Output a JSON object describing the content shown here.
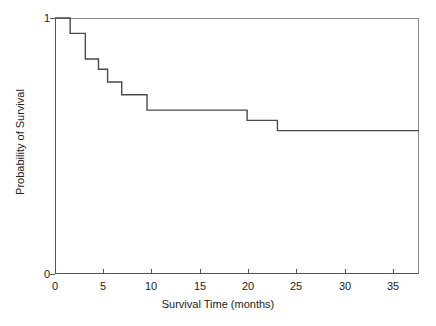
{
  "chart_data": {
    "type": "line",
    "title": "",
    "subtitle": "",
    "xlabel": "Survival Time (months)",
    "ylabel": "Probability of Survival",
    "xlim": [
      0,
      36
    ],
    "ylim": [
      0,
      1
    ],
    "xticks": [
      0,
      5,
      10,
      15,
      20,
      25,
      30,
      35
    ],
    "xtick_labels": [
      "0",
      "5",
      "10",
      "15",
      "20",
      "25",
      "30",
      "35"
    ],
    "yticks": [
      0,
      1
    ],
    "ytick_labels": [
      "0",
      "1"
    ],
    "grid": false,
    "legend": null,
    "annotations": [],
    "series": [
      {
        "name": "Kaplan-Meier survival estimate",
        "style": "step-post",
        "color": "#4a4a4a",
        "x": [
          0,
          1.5,
          1.5,
          3.0,
          3.0,
          4.3,
          4.3,
          5.2,
          5.2,
          6.6,
          6.6,
          9.1,
          9.1,
          19.0,
          19.0,
          22.0,
          22.0,
          36.0
        ],
        "y": [
          1.0,
          1.0,
          0.94,
          0.94,
          0.84,
          0.84,
          0.8,
          0.8,
          0.75,
          0.75,
          0.7,
          0.7,
          0.64,
          0.64,
          0.6,
          0.6,
          0.56,
          0.56
        ],
        "steps": [
          {
            "time": 0.0,
            "survival": 1.0
          },
          {
            "time": 1.5,
            "survival": 0.94
          },
          {
            "time": 3.0,
            "survival": 0.84
          },
          {
            "time": 4.3,
            "survival": 0.8
          },
          {
            "time": 5.2,
            "survival": 0.75
          },
          {
            "time": 6.6,
            "survival": 0.7
          },
          {
            "time": 9.1,
            "survival": 0.64
          },
          {
            "time": 19.0,
            "survival": 0.6
          },
          {
            "time": 22.0,
            "survival": 0.56
          },
          {
            "time": 36.0,
            "survival": 0.56
          }
        ]
      }
    ]
  },
  "axes": {
    "x_title": "Survival Time (months)",
    "y_title": "Probability of Survival",
    "y_top_label": "1",
    "y_bottom_label": "0",
    "x_labels": [
      "0",
      "5",
      "10",
      "15",
      "20",
      "25",
      "30",
      "35"
    ]
  },
  "colors": {
    "curve": "#4a4a4a",
    "axis": "#555555",
    "frame": "#8a8a8a",
    "background": "#ffffff",
    "text": "#222222"
  }
}
